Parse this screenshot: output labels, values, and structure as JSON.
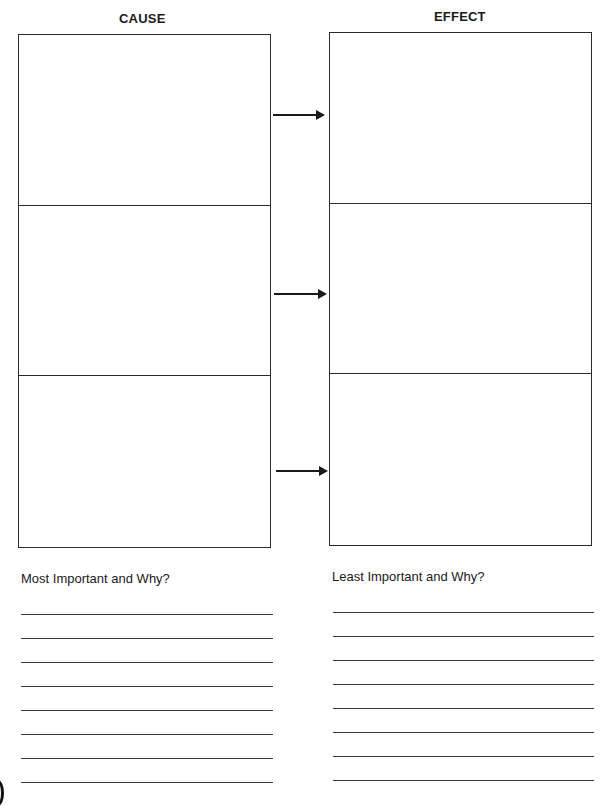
{
  "worksheet": {
    "columns": [
      {
        "heading": "CAUSE",
        "rows": 3
      },
      {
        "heading": "EFFECT",
        "rows": 3
      }
    ],
    "arrows": [
      {
        "from": "cause-1",
        "to": "effect-1",
        "icon": "arrow-right-icon"
      },
      {
        "from": "cause-2",
        "to": "effect-2",
        "icon": "arrow-right-icon"
      },
      {
        "from": "cause-3",
        "to": "effect-3",
        "icon": "arrow-right-icon"
      }
    ],
    "prompts": {
      "left": {
        "label": "Most Important and Why?",
        "line_count": 8
      },
      "right": {
        "label": "Least Important and Why?",
        "line_count": 8
      }
    },
    "colors": {
      "ink": "#1a1a1a",
      "paper": "#ffffff"
    }
  }
}
